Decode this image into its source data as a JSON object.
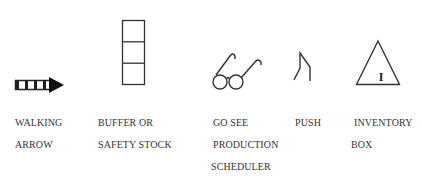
{
  "symbols": [
    {
      "id": "walking-arrow",
      "icon": "walking-arrow-icon",
      "label_lines": [
        "WALKING",
        "ARROW"
      ]
    },
    {
      "id": "buffer-safety-stock",
      "icon": "buffer-stack-icon",
      "label_lines": [
        "BUFFER OR",
        "SAFETY STOCK"
      ]
    },
    {
      "id": "go-see-production-scheduler",
      "icon": "eyeglasses-icon",
      "label_lines": [
        "GO SEE",
        "PRODUCTION",
        "SCHEDULER"
      ]
    },
    {
      "id": "push",
      "icon": "push-icon",
      "label_lines": [
        "PUSH"
      ]
    },
    {
      "id": "inventory-box",
      "icon": "inventory-triangle-icon",
      "label_lines": [
        "INVENTORY",
        "BOX"
      ],
      "icon_text": "I"
    }
  ],
  "colors": {
    "stroke": "#333333",
    "background": "#ffffff"
  }
}
